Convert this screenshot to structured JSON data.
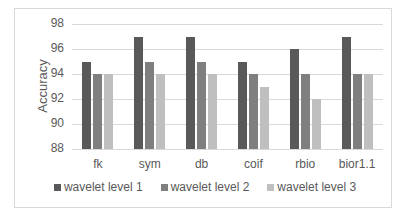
{
  "chart_data": {
    "type": "bar",
    "title": "",
    "xlabel": "",
    "ylabel": "Accuracy",
    "ylim": [
      88,
      98
    ],
    "yticks": [
      88,
      90,
      92,
      94,
      96,
      98
    ],
    "grid": true,
    "legend_position": "bottom",
    "categories": [
      "fk",
      "sym",
      "db",
      "coif",
      "rbio",
      "bior1.1"
    ],
    "series": [
      {
        "name": "wavelet level 1",
        "color": "#595959",
        "values": [
          95,
          97,
          97,
          95,
          96,
          97
        ]
      },
      {
        "name": "wavelet level 2",
        "color": "#7f7f7f",
        "values": [
          94,
          95,
          95,
          94,
          94,
          94
        ]
      },
      {
        "name": "wavelet level 3",
        "color": "#bfbfbf",
        "values": [
          94,
          94,
          94,
          93,
          92,
          94
        ]
      }
    ]
  }
}
